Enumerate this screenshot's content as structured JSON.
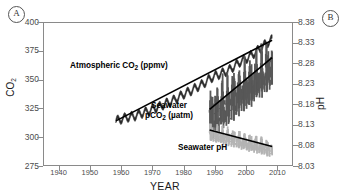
{
  "panels": {
    "a": "A",
    "b": "B"
  },
  "chart_data": {
    "type": "line",
    "title": "",
    "xlabel": "YEAR",
    "ylabel": "CO2",
    "ylabel_right": "pH",
    "xlim": [
      1935,
      2015
    ],
    "ylim": [
      275,
      400
    ],
    "ylim_right": [
      8.03,
      8.38
    ],
    "grid": false,
    "legend": "inline-annotations",
    "xticks": [
      1940,
      1950,
      1960,
      1970,
      1980,
      1990,
      2000,
      2010
    ],
    "yticks": [
      275,
      300,
      325,
      350,
      375,
      400
    ],
    "yticks_right": [
      8.03,
      8.08,
      8.13,
      8.18,
      8.23,
      8.28,
      8.33,
      8.38
    ],
    "annotations": [
      {
        "text": "Atmospheric CO2 (ppmv)",
        "x": 1962,
        "y": 357
      },
      {
        "text": "Seawater pCO2 (µatm)",
        "x": 1981,
        "y": 332
      },
      {
        "text": "Seawater pH",
        "x": 1993,
        "y": 287
      }
    ],
    "series": [
      {
        "name": "Atmospheric CO2 (ppmv)",
        "axis": "left",
        "style": "noisy-line",
        "color": "#2b2b2b",
        "x_start": 1958,
        "x_end": 2008,
        "y_start": 315,
        "y_end": 385,
        "points": [
          {
            "x": 1958,
            "y": 315
          },
          {
            "x": 1960,
            "y": 316.9
          },
          {
            "x": 1962,
            "y": 318.4
          },
          {
            "x": 1964,
            "y": 319.2
          },
          {
            "x": 1966,
            "y": 321.4
          },
          {
            "x": 1968,
            "y": 323.0
          },
          {
            "x": 1970,
            "y": 325.7
          },
          {
            "x": 1972,
            "y": 327.4
          },
          {
            "x": 1974,
            "y": 330.2
          },
          {
            "x": 1976,
            "y": 332.2
          },
          {
            "x": 1978,
            "y": 335.4
          },
          {
            "x": 1980,
            "y": 338.7
          },
          {
            "x": 1982,
            "y": 341.1
          },
          {
            "x": 1984,
            "y": 344.4
          },
          {
            "x": 1986,
            "y": 347.2
          },
          {
            "x": 1988,
            "y": 351.6
          },
          {
            "x": 1990,
            "y": 354.4
          },
          {
            "x": 1992,
            "y": 356.4
          },
          {
            "x": 1994,
            "y": 358.8
          },
          {
            "x": 1996,
            "y": 362.6
          },
          {
            "x": 1998,
            "y": 366.7
          },
          {
            "x": 2000,
            "y": 369.5
          },
          {
            "x": 2002,
            "y": 373.2
          },
          {
            "x": 2004,
            "y": 377.5
          },
          {
            "x": 2006,
            "y": 381.9
          },
          {
            "x": 2008,
            "y": 385.6
          }
        ]
      },
      {
        "name": "Seawater pCO2 (µatm)",
        "axis": "left",
        "style": "noisy-band",
        "color": "#585858",
        "x_start": 1988,
        "x_end": 2008,
        "trend_y_start": 325,
        "trend_y_end": 370,
        "noise_amplitude": 22
      },
      {
        "name": "Seawater pH",
        "axis": "right",
        "style": "noisy-band",
        "color": "#b4b4b4",
        "x_start": 1988,
        "x_end": 2008,
        "trend_y_start": 8.12,
        "trend_y_end": 8.08,
        "noise_amplitude": 0.022
      }
    ],
    "trendlines": [
      {
        "name": "Seawater pCO2 trend",
        "axis": "left",
        "x": [
          1988,
          2008
        ],
        "y": [
          325,
          370
        ],
        "color": "#000000"
      },
      {
        "name": "Seawater pH trend",
        "axis": "right",
        "x": [
          1988,
          2008
        ],
        "y": [
          8.12,
          8.08
        ],
        "color": "#000000"
      },
      {
        "name": "Atmospheric CO2 trend",
        "axis": "left",
        "x": [
          1958,
          2008
        ],
        "y": [
          315,
          385
        ],
        "color": "#000000"
      }
    ]
  }
}
